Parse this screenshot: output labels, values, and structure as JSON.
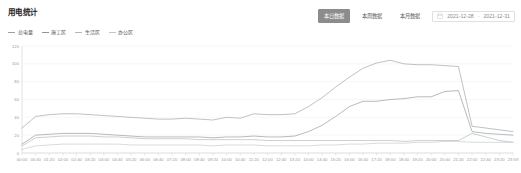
{
  "header": {
    "title": "用电统计",
    "buttons": [
      {
        "label": "本日数据",
        "active": true
      },
      {
        "label": "本周数据",
        "active": false
      },
      {
        "label": "本月数据",
        "active": false
      }
    ],
    "date_range": {
      "icon": "calendar-icon",
      "start": "2021-12-28",
      "separator": "-",
      "end": "2021-12-31",
      "chevron": "chevron-down-icon"
    }
  },
  "legend": {
    "position": "top-left",
    "items": [
      {
        "label": "总电量",
        "color": "#9aa0a6"
      },
      {
        "label": "施工区",
        "color": "#8f959b"
      },
      {
        "label": "生活区",
        "color": "#b0b6bb"
      },
      {
        "label": "办公区",
        "color": "#c2c7cb"
      }
    ]
  },
  "chart_data": {
    "type": "line",
    "title": "用电统计",
    "xlabel": "",
    "ylabel": "",
    "ylim": [
      0,
      120
    ],
    "yticks": [
      0,
      20,
      40,
      60,
      80,
      100,
      120
    ],
    "grid": true,
    "legend_position": "top-left",
    "categories": [
      "00:00",
      "00:40",
      "01:20",
      "02:00",
      "02:40",
      "03:20",
      "04:00",
      "04:40",
      "05:20",
      "06:00",
      "06:40",
      "07:20",
      "08:00",
      "08:40",
      "09:20",
      "10:00",
      "10:40",
      "11:20",
      "12:00",
      "12:40",
      "13:20",
      "14:00",
      "14:40",
      "15:20",
      "16:00",
      "16:40",
      "17:20",
      "18:00",
      "18:40",
      "19:20",
      "20:00",
      "20:40",
      "21:20",
      "22:00",
      "22:40",
      "23:20",
      "23:59"
    ],
    "xticks": [
      "00:00",
      "00:40",
      "01:20",
      "02:00",
      "02:40",
      "03:20",
      "04:00",
      "04:40",
      "05:20",
      "06:00",
      "06:40",
      "07:20",
      "08:00",
      "08:40",
      "09:20",
      "10:00",
      "10:40",
      "11:20",
      "12:00",
      "12:40",
      "13:20",
      "14:00",
      "14:40",
      "15:20",
      "16:00",
      "16:40",
      "17:20",
      "18:00",
      "18:40",
      "19:20",
      "20:00",
      "20:40",
      "21:20",
      "22:00",
      "22:40",
      "23:20",
      "23:59"
    ],
    "series": [
      {
        "name": "总电量",
        "color": "#9aa0a6",
        "values": [
          28,
          41,
          43,
          44,
          44,
          43,
          42,
          41,
          40,
          39,
          38,
          38,
          39,
          38,
          37,
          40,
          39,
          44,
          43,
          43,
          44,
          52,
          62,
          74,
          85,
          95,
          101,
          104,
          100,
          99,
          99,
          98,
          97,
          30,
          28,
          26,
          24
        ]
      },
      {
        "name": "施工区",
        "color": "#8f959b",
        "values": [
          10,
          20,
          21,
          22,
          22,
          22,
          21,
          20,
          19,
          18,
          18,
          18,
          18,
          18,
          17,
          18,
          18,
          19,
          18,
          18,
          19,
          24,
          31,
          41,
          52,
          58,
          58,
          60,
          61,
          63,
          63,
          69,
          70,
          24,
          22,
          21,
          20
        ]
      },
      {
        "name": "生活区",
        "color": "#b0b6bb",
        "values": [
          8,
          17,
          18,
          19,
          19,
          19,
          18,
          18,
          17,
          16,
          16,
          16,
          16,
          15,
          15,
          15,
          15,
          15,
          14,
          14,
          14,
          14,
          14,
          14,
          14,
          14,
          14,
          14,
          13,
          14,
          14,
          14,
          14,
          22,
          18,
          14,
          12
        ]
      },
      {
        "name": "办公区",
        "color": "#c2c7cb",
        "values": [
          4,
          8,
          9,
          10,
          10,
          10,
          10,
          10,
          9,
          9,
          9,
          9,
          9,
          9,
          8,
          9,
          9,
          9,
          8,
          8,
          8,
          8,
          9,
          9,
          10,
          10,
          11,
          11,
          11,
          12,
          12,
          13,
          13,
          12,
          12,
          12,
          12
        ]
      }
    ]
  }
}
